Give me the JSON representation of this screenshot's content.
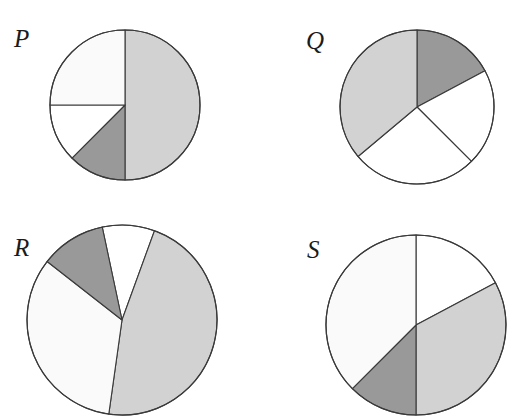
{
  "figure": {
    "type": "pie-chart-grid",
    "background_color": "#ffffff",
    "rows": 2,
    "columns": 4
  },
  "palette": {
    "light_gray": "#d2d2d2",
    "medium_gray": "#999999",
    "off_white": "#fafafa",
    "white": "#ffffff",
    "outline": "#3a3a3a",
    "label_color": "#1b1b1b"
  },
  "charts": [
    {
      "id": "P",
      "label": "P",
      "center_x": 125,
      "center_y": 105,
      "radius": 75,
      "label_x": 14,
      "label_y": 26,
      "slices": [
        {
          "name": "slice-1",
          "start_deg": 0,
          "sweep_deg": 180,
          "fill": "#d2d2d2",
          "percent": 50.0
        },
        {
          "name": "slice-2",
          "start_deg": 180,
          "sweep_deg": 45,
          "fill": "#999999",
          "percent": 12.5
        },
        {
          "name": "slice-3",
          "start_deg": 225,
          "sweep_deg": 45,
          "fill": "#ffffff",
          "percent": 12.5
        },
        {
          "name": "slice-4",
          "start_deg": 270,
          "sweep_deg": 90,
          "fill": "#fafafa",
          "percent": 25.0
        }
      ]
    },
    {
      "id": "Q",
      "label": "Q",
      "center_x": 417,
      "center_y": 107,
      "radius": 77,
      "label_x": 306,
      "label_y": 28,
      "slices": [
        {
          "name": "slice-1",
          "start_deg": 0,
          "sweep_deg": 62,
          "fill": "#999999",
          "percent": 17.2
        },
        {
          "name": "slice-2",
          "start_deg": 62,
          "sweep_deg": 73,
          "fill": "#ffffff",
          "percent": 20.3
        },
        {
          "name": "slice-3",
          "start_deg": 135,
          "sweep_deg": 95,
          "fill": "#ffffff",
          "percent": 26.4
        },
        {
          "name": "slice-4",
          "start_deg": 230,
          "sweep_deg": 130,
          "fill": "#d2d2d2",
          "percent": 36.1
        }
      ]
    },
    {
      "id": "R",
      "label": "R",
      "center_x": 122,
      "center_y": 320,
      "radius": 95,
      "label_x": 14,
      "label_y": 235,
      "slices": [
        {
          "name": "slice-1",
          "start_deg": -12,
          "sweep_deg": 32,
          "fill": "#ffffff",
          "percent": 8.9
        },
        {
          "name": "slice-2",
          "start_deg": 20,
          "sweep_deg": 168,
          "fill": "#d2d2d2",
          "percent": 46.7
        },
        {
          "name": "slice-3",
          "start_deg": 188,
          "sweep_deg": 120,
          "fill": "#fafafa",
          "percent": 33.3
        },
        {
          "name": "slice-4",
          "start_deg": 308,
          "sweep_deg": 40,
          "fill": "#999999",
          "percent": 11.1
        }
      ]
    },
    {
      "id": "S",
      "label": "S",
      "center_x": 416,
      "center_y": 325,
      "radius": 90,
      "label_x": 307,
      "label_y": 237,
      "slices": [
        {
          "name": "slice-1",
          "start_deg": 0,
          "sweep_deg": 62,
          "fill": "#ffffff",
          "percent": 17.2
        },
        {
          "name": "slice-2",
          "start_deg": 62,
          "sweep_deg": 118,
          "fill": "#d2d2d2",
          "percent": 32.8
        },
        {
          "name": "slice-3",
          "start_deg": 180,
          "sweep_deg": 45,
          "fill": "#999999",
          "percent": 12.5
        },
        {
          "name": "slice-4",
          "start_deg": 225,
          "sweep_deg": 135,
          "fill": "#fafafa",
          "percent": 37.5
        }
      ]
    }
  ],
  "chart_data": {
    "type": "pie",
    "title": "",
    "xlabel": "",
    "ylabel": "",
    "legend_position": "none",
    "grid": false,
    "note": "Four unlabeled pie charts arranged in a 2x2 grid; each identified by an italic serif letter. Values are slice sweep angles in degrees measured clockwise from the 12 o'clock direction, with equivalent percentages of the whole circle.",
    "panels": [
      {
        "name": "P",
        "categories": [
          "slice-1",
          "slice-2",
          "slice-3",
          "slice-4"
        ],
        "values": [
          50.0,
          12.5,
          12.5,
          25.0
        ],
        "angles_deg": [
          180,
          45,
          45,
          90
        ],
        "colors": [
          "#d2d2d2",
          "#999999",
          "#ffffff",
          "#fafafa"
        ]
      },
      {
        "name": "Q",
        "categories": [
          "slice-1",
          "slice-2",
          "slice-3",
          "slice-4"
        ],
        "values": [
          17.2,
          20.3,
          26.4,
          36.1
        ],
        "angles_deg": [
          62,
          73,
          95,
          130
        ],
        "colors": [
          "#999999",
          "#ffffff",
          "#ffffff",
          "#d2d2d2"
        ]
      },
      {
        "name": "R",
        "categories": [
          "slice-1",
          "slice-2",
          "slice-3",
          "slice-4"
        ],
        "values": [
          8.9,
          46.7,
          33.3,
          11.1
        ],
        "angles_deg": [
          32,
          168,
          120,
          40
        ],
        "colors": [
          "#ffffff",
          "#d2d2d2",
          "#fafafa",
          "#999999"
        ]
      },
      {
        "name": "S",
        "categories": [
          "slice-1",
          "slice-2",
          "slice-3",
          "slice-4"
        ],
        "values": [
          17.2,
          32.8,
          12.5,
          37.5
        ],
        "angles_deg": [
          62,
          118,
          45,
          135
        ],
        "colors": [
          "#ffffff",
          "#d2d2d2",
          "#999999",
          "#fafafa"
        ]
      }
    ]
  }
}
